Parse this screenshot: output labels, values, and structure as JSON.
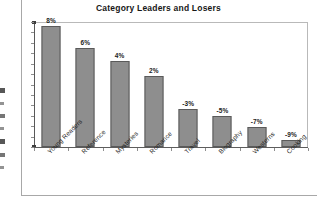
{
  "chart_data": {
    "type": "bar",
    "title": "Category Leaders and Losers",
    "xlabel": "",
    "ylabel": "",
    "grid": false,
    "legend": "none",
    "axis_tick_labels_y": [],
    "categories": [
      "Young Readers",
      "Reference",
      "Mysteries",
      "Romance",
      "Travel",
      "Biography",
      "Westerns",
      "Cooking"
    ],
    "values": [
      8,
      6,
      4,
      2,
      -3,
      -5,
      -7,
      -9
    ],
    "data_labels": [
      "8%",
      "6%",
      "4%",
      "2%",
      "-3%",
      "-5%",
      "-7%",
      "-9%"
    ],
    "bar_pixel_fractions": [
      1.0,
      0.815,
      0.715,
      0.59,
      0.315,
      0.255,
      0.165,
      0.055
    ],
    "ylim": [
      0,
      1
    ]
  },
  "style": {
    "bar_fill": "#8e8e8e",
    "bar_stroke": "#5a5a5a",
    "frame_color": "#b9b9b9",
    "axis_color": "#5d5d5d",
    "text_color": "#1c1c1c",
    "background": "#ffffff"
  }
}
